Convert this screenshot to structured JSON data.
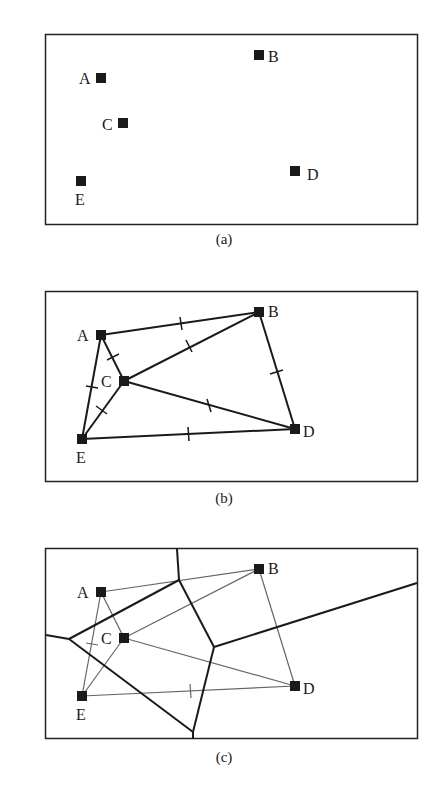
{
  "panels": [
    {
      "id": "a",
      "caption": "(a)",
      "content": "points only"
    },
    {
      "id": "b",
      "caption": "(b)",
      "content": "Delaunay triangulation with perpendicular-bisector tick marks"
    },
    {
      "id": "c",
      "caption": "(c)",
      "content": "Voronoi diagram overlaid on triangulation"
    }
  ],
  "points": [
    {
      "name": "A",
      "label": "A"
    },
    {
      "name": "B",
      "label": "B"
    },
    {
      "name": "C",
      "label": "C"
    },
    {
      "name": "D",
      "label": "D"
    },
    {
      "name": "E",
      "label": "E"
    }
  ],
  "edges": [
    "A-B",
    "A-C",
    "A-E",
    "B-C",
    "B-D",
    "C-D",
    "C-E",
    "D-E"
  ],
  "colors": {
    "ink": "#1a1a1a",
    "thin_line": "#555555",
    "frame": "#222222",
    "background": "#ffffff"
  }
}
